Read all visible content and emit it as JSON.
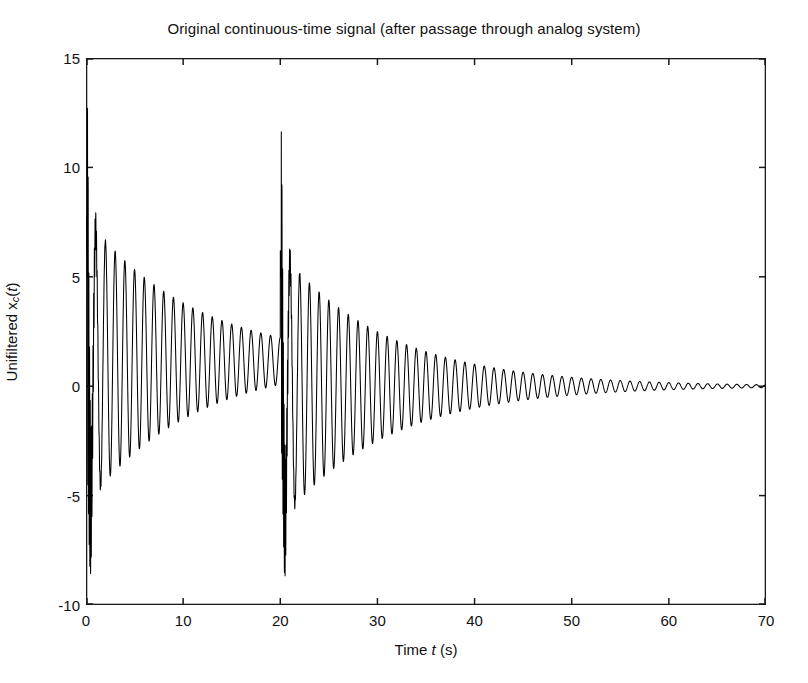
{
  "chart_data": {
    "type": "line",
    "title": "Original continuous-time signal (after passage through analog system)",
    "xlabel": "Time t (s)",
    "ylabel": "Unifiltered x_c(t)",
    "ylabel_parts": {
      "prefix": "Unifiltered x",
      "subscript": "c",
      "suffix_open": "(",
      "suffix_var": "t",
      "suffix_close": ")"
    },
    "xlabel_parts": {
      "prefix": "Time ",
      "var": "t",
      "suffix": " (s)"
    },
    "xlim": [
      0,
      70
    ],
    "ylim": [
      -10,
      15
    ],
    "xticks": [
      0,
      10,
      20,
      30,
      40,
      50,
      60,
      70
    ],
    "yticks": [
      15,
      10,
      5,
      0,
      -5,
      -10
    ],
    "xtick_labels": [
      "0",
      "10",
      "20",
      "30",
      "40",
      "50",
      "60",
      "70"
    ],
    "ytick_labels": [
      "15",
      "10",
      "5",
      "0",
      "-5",
      "-10"
    ],
    "grid": false,
    "legend": false,
    "line_color": "#000000",
    "line_width": 1.0,
    "axis_color": "#1a1a1a",
    "background": "#ffffff",
    "tick_direction": "in",
    "series": [
      {
        "name": "x_c(t)",
        "description": "Damped sinusoid with step-changing DC offset and high-frequency transient bursts at t=0 and t=20",
        "model": {
          "segment1": {
            "t_start": 0,
            "t_end": 20,
            "dc_offset": 1.15,
            "amplitude0": 6.6,
            "decay_tau": 11.0,
            "frequency_hz": 1.0,
            "phase_deg": 0
          },
          "segment2": {
            "t_start": 20,
            "t_end": 70,
            "dc_offset": 0.0,
            "amplitude0": 6.2,
            "decay_tau": 11.0,
            "frequency_hz": 1.0,
            "phase_deg": 0
          },
          "transient1": {
            "t_center": 0.15,
            "peak_high": 11.5,
            "peak_low": -6.7,
            "decay_tau": 0.35,
            "frequency_hz": 14
          },
          "transient2": {
            "t_center": 20.1,
            "peak_high": 6.3,
            "peak_low": -9.3,
            "decay_tau": 0.38,
            "frequency_hz": 14
          }
        },
        "key_points": [
          {
            "t": 0.0,
            "x": 1.2
          },
          {
            "t": 0.12,
            "x": 11.5
          },
          {
            "t": 0.3,
            "x": -6.7
          },
          {
            "t": 0.55,
            "x": 7.6
          },
          {
            "t": 1.0,
            "x": -5.3
          },
          {
            "t": 2.0,
            "x": 7.1
          },
          {
            "t": 5.0,
            "x": 5.2
          },
          {
            "t": 10.0,
            "x": 3.8
          },
          {
            "t": 15.0,
            "x": 2.8
          },
          {
            "t": 19.8,
            "x": 2.2
          },
          {
            "t": 20.05,
            "x": -9.3
          },
          {
            "t": 20.2,
            "x": 6.3
          },
          {
            "t": 21.0,
            "x": -5.9
          },
          {
            "t": 25.0,
            "x": 4.2
          },
          {
            "t": 30.0,
            "x": 2.9
          },
          {
            "t": 40.0,
            "x": 1.3
          },
          {
            "t": 50.0,
            "x": 0.6
          },
          {
            "t": 60.0,
            "x": 0.25
          },
          {
            "t": 70.0,
            "x": 0.12
          }
        ]
      }
    ]
  }
}
